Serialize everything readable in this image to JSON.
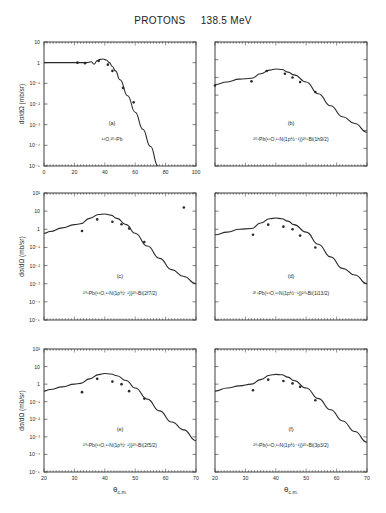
{
  "figure": {
    "title_particle": "PROTONS",
    "title_energy": "138.5 MeV",
    "y_axis_label": "dσ/dΩ (mb/sr)",
    "x_axis_label": "θ",
    "x_axis_label_sub": "c.m."
  },
  "chart_data": [
    {
      "panel": "(a)",
      "type": "line",
      "label": "¹⁶O,²⁰⁸Pb",
      "xlim": [
        0,
        100
      ],
      "ylim_log10": [
        -5,
        1
      ],
      "x_ticks": [
        0,
        20,
        40,
        60,
        80,
        100
      ],
      "y_ticks": [
        "10",
        "1",
        "10⁻¹",
        "10⁻²",
        "10⁻³",
        "10⁻⁴",
        "10⁻⁵"
      ],
      "curve": {
        "x": [
          0,
          20,
          28,
          31,
          33,
          35,
          37,
          39,
          41,
          43,
          45,
          47,
          50,
          55,
          60,
          65,
          70,
          75
        ],
        "y": [
          1.0,
          1.0,
          1.0,
          1.1,
          0.85,
          1.25,
          1.45,
          1.5,
          1.35,
          1.0,
          0.65,
          0.4,
          0.15,
          0.025,
          0.004,
          0.0006,
          9e-05,
          1e-05
        ]
      },
      "points": {
        "x": [
          22,
          27,
          36,
          42,
          45,
          52,
          59
        ],
        "y": [
          1.0,
          0.95,
          1.2,
          0.8,
          0.4,
          0.06,
          0.012
        ]
      },
      "grid": false
    },
    {
      "panel": "(b)",
      "type": "line",
      "label": "²⁰⁸Pb(¹⁶O,¹⁵N(1p½⁻¹))²⁰⁹Bi(1h9/2)",
      "xlim": [
        20,
        70
      ],
      "ylim_log10": [
        -5,
        2
      ],
      "curve": {
        "x": [
          20,
          24,
          28,
          32,
          35,
          38,
          40,
          42,
          44,
          46,
          50,
          54,
          58,
          62,
          66,
          70
        ],
        "y": [
          0.4,
          0.55,
          0.8,
          0.9,
          1.6,
          2.6,
          3.0,
          2.8,
          2.0,
          1.4,
          0.55,
          0.12,
          0.025,
          0.006,
          0.0025,
          0.0008
        ]
      },
      "points": {
        "x": [
          20,
          32,
          37,
          43,
          45.5,
          48,
          53
        ],
        "y": [
          0.35,
          0.6,
          2.3,
          1.6,
          1.0,
          0.55,
          0.15
        ]
      },
      "grid": false
    },
    {
      "panel": "(c)",
      "type": "line",
      "label": "²⁰⁸Pb(¹⁶O,¹⁵N(1p½⁻¹))²⁰⁹Bi(2f7/2)",
      "xlim": [
        20,
        70
      ],
      "ylim_log10": [
        -5,
        2
      ],
      "y_ticks": [
        "10²",
        "10",
        "1",
        "10⁻¹",
        "10⁻²",
        "10⁻³",
        "10⁻⁴",
        "10⁻⁵"
      ],
      "curve": {
        "x": [
          20,
          22,
          26,
          30,
          32,
          35,
          38,
          40,
          42,
          44,
          47,
          50,
          54,
          58,
          62,
          66,
          70
        ],
        "y": [
          0.6,
          0.75,
          1.2,
          1.8,
          2.0,
          4.0,
          6.5,
          7.0,
          6.0,
          4.0,
          1.8,
          0.6,
          0.12,
          0.025,
          0.006,
          0.0025,
          0.001
        ]
      },
      "points": {
        "x": [
          32.5,
          37.5,
          42.5,
          45.5,
          48,
          53,
          66
        ],
        "y": [
          0.8,
          3.5,
          2.6,
          1.9,
          1.1,
          0.2,
          16
        ]
      },
      "grid": false
    },
    {
      "panel": "(d)",
      "type": "line",
      "label": "²⁰⁸Pb(¹⁶O,¹⁵N(1p½⁻¹))²⁰⁹Bi(1i13/2)",
      "xlim": [
        20,
        70
      ],
      "ylim_log10": [
        -5,
        2
      ],
      "curve": {
        "x": [
          20,
          24,
          28,
          32,
          35,
          38,
          40,
          42,
          44,
          46,
          50,
          54,
          58,
          62,
          66,
          70
        ],
        "y": [
          0.5,
          0.7,
          1.0,
          1.1,
          2.2,
          3.8,
          4.2,
          3.8,
          2.8,
          1.8,
          0.7,
          0.15,
          0.03,
          0.007,
          0.003,
          0.001
        ]
      },
      "points": {
        "x": [
          32.5,
          37.5,
          42.5,
          45.5,
          48,
          53
        ],
        "y": [
          0.5,
          1.8,
          1.4,
          1.0,
          0.45,
          0.1
        ]
      },
      "grid": false
    },
    {
      "panel": "(e)",
      "type": "line",
      "label": "²⁰⁸Pb(¹⁶O,¹⁵N(1p½⁻¹))²⁰⁹Bi(2f5/2)",
      "xlim": [
        20,
        70
      ],
      "ylim_log10": [
        -5,
        2
      ],
      "x_ticks": [
        20,
        30,
        40,
        50,
        60,
        70
      ],
      "y_ticks": [
        "10²",
        "10",
        "1",
        "10⁻¹",
        "10⁻²",
        "10⁻³",
        "10⁻⁴",
        "10⁻⁵"
      ],
      "curve": {
        "x": [
          20,
          22,
          26,
          30,
          32,
          35,
          38,
          40,
          42,
          44,
          47,
          50,
          54,
          58,
          62,
          66,
          70
        ],
        "y": [
          0.4,
          0.5,
          0.7,
          1.0,
          1.1,
          2.0,
          3.5,
          4.0,
          3.8,
          3.0,
          1.6,
          0.6,
          0.14,
          0.03,
          0.007,
          0.0025,
          0.0006
        ]
      },
      "points": {
        "x": [
          32.5,
          37.5,
          42.5,
          45.5,
          48,
          53
        ],
        "y": [
          0.35,
          2.0,
          1.4,
          1.0,
          0.4,
          0.15
        ]
      },
      "grid": false
    },
    {
      "panel": "(f)",
      "type": "line",
      "label": "²⁰⁸Pb(¹⁶O,¹⁵N(1p½⁻¹))²⁰⁹Bi(3p3/2)",
      "xlim": [
        20,
        70
      ],
      "ylim_log10": [
        -5,
        2
      ],
      "x_ticks": [
        20,
        30,
        40,
        50,
        60,
        70
      ],
      "curve": {
        "x": [
          20,
          24,
          28,
          32,
          35,
          38,
          40,
          42,
          44,
          46,
          50,
          54,
          58,
          62,
          66,
          70
        ],
        "y": [
          0.4,
          0.6,
          0.8,
          1.0,
          1.8,
          3.2,
          3.6,
          3.4,
          2.5,
          1.6,
          0.6,
          0.15,
          0.035,
          0.008,
          0.002,
          0.0005
        ]
      },
      "points": {
        "x": [
          32.5,
          37.5,
          42.5,
          45.5,
          48,
          53
        ],
        "y": [
          0.45,
          1.8,
          1.5,
          1.1,
          0.7,
          0.12
        ]
      },
      "grid": false
    }
  ]
}
